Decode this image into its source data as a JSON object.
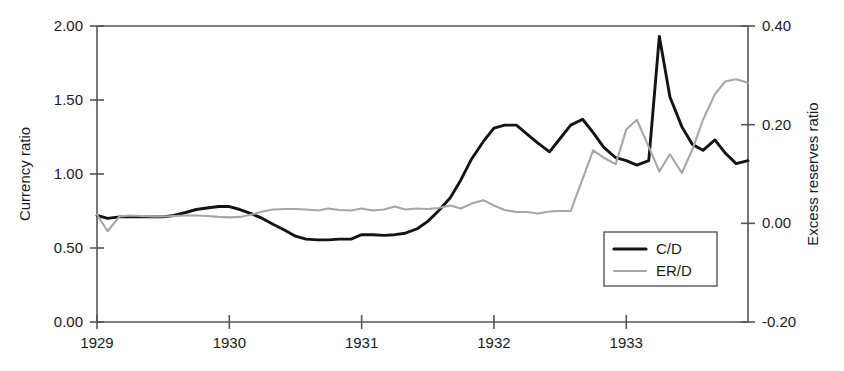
{
  "chart_data": {
    "type": "line",
    "title": "",
    "xlabel": "",
    "ylabel": "Currency ratio",
    "y2label": "Excess reserves ratio",
    "grid": false,
    "legend_position": "inside-bottom-right",
    "xlim": [
      1929.0,
      1933.92
    ],
    "ylim": [
      0.0,
      2.0
    ],
    "y2lim": [
      -0.2,
      0.4
    ],
    "xticks": [
      "1929",
      "1930",
      "1931",
      "1932",
      "1933"
    ],
    "xtick_values": [
      1929,
      1930,
      1931,
      1932,
      1933
    ],
    "yticks": [
      "0.00",
      "0.50",
      "1.00",
      "1.50",
      "2.00"
    ],
    "ytick_values": [
      0.0,
      0.5,
      1.0,
      1.5,
      2.0
    ],
    "y2ticks": [
      "-0.20",
      "0.00",
      "0.20",
      "0.40"
    ],
    "y2tick_values": [
      -0.2,
      0.0,
      0.2,
      0.4
    ],
    "series": [
      {
        "name": "C/D",
        "axis": "left",
        "color": "#141414",
        "x": [
          1929.0,
          1929.08,
          1929.17,
          1929.25,
          1929.33,
          1929.42,
          1929.5,
          1929.58,
          1929.67,
          1929.75,
          1929.83,
          1929.92,
          1930.0,
          1930.08,
          1930.17,
          1930.25,
          1930.33,
          1930.42,
          1930.5,
          1930.58,
          1930.67,
          1930.75,
          1930.83,
          1930.92,
          1931.0,
          1931.08,
          1931.17,
          1931.25,
          1931.33,
          1931.42,
          1931.5,
          1931.58,
          1931.67,
          1931.75,
          1931.83,
          1931.92,
          1932.0,
          1932.08,
          1932.17,
          1932.25,
          1932.33,
          1932.42,
          1932.5,
          1932.58,
          1932.67,
          1932.75,
          1932.83,
          1932.92,
          1933.0,
          1933.08,
          1933.17,
          1933.25,
          1933.33,
          1933.42,
          1933.5,
          1933.58,
          1933.67,
          1933.75,
          1933.83,
          1933.92
        ],
        "values": [
          0.72,
          0.7,
          0.71,
          0.71,
          0.71,
          0.71,
          0.71,
          0.72,
          0.74,
          0.76,
          0.77,
          0.78,
          0.78,
          0.76,
          0.73,
          0.7,
          0.66,
          0.62,
          0.58,
          0.56,
          0.555,
          0.555,
          0.56,
          0.56,
          0.59,
          0.59,
          0.585,
          0.59,
          0.6,
          0.63,
          0.68,
          0.75,
          0.84,
          0.96,
          1.1,
          1.22,
          1.31,
          1.33,
          1.33,
          1.27,
          1.21,
          1.15,
          1.24,
          1.33,
          1.37,
          1.28,
          1.18,
          1.11,
          1.09,
          1.06,
          1.09,
          1.93,
          1.52,
          1.32,
          1.2,
          1.16,
          1.23,
          1.14,
          1.07,
          1.09
        ]
      },
      {
        "name": "ER/D",
        "axis": "right",
        "color": "#a6a6a6",
        "x": [
          1929.0,
          1929.08,
          1929.17,
          1929.25,
          1929.33,
          1929.42,
          1929.5,
          1929.58,
          1929.67,
          1929.75,
          1929.83,
          1929.92,
          1930.0,
          1930.08,
          1930.17,
          1930.25,
          1930.33,
          1930.42,
          1930.5,
          1930.58,
          1930.67,
          1930.75,
          1930.83,
          1930.92,
          1931.0,
          1931.08,
          1931.17,
          1931.25,
          1931.33,
          1931.42,
          1931.5,
          1931.58,
          1931.67,
          1931.75,
          1931.83,
          1931.92,
          1932.0,
          1932.08,
          1932.17,
          1932.25,
          1932.33,
          1932.42,
          1932.5,
          1932.58,
          1932.67,
          1932.75,
          1932.83,
          1932.92,
          1933.0,
          1933.08,
          1933.17,
          1933.25,
          1933.33,
          1933.42,
          1933.5,
          1933.58,
          1933.67,
          1933.75,
          1933.83,
          1933.92
        ],
        "values": [
          0.018,
          -0.016,
          0.014,
          0.016,
          0.015,
          0.014,
          0.014,
          0.015,
          0.016,
          0.016,
          0.015,
          0.013,
          0.012,
          0.013,
          0.018,
          0.024,
          0.028,
          0.029,
          0.029,
          0.028,
          0.026,
          0.03,
          0.027,
          0.026,
          0.03,
          0.026,
          0.028,
          0.034,
          0.028,
          0.03,
          0.029,
          0.031,
          0.036,
          0.03,
          0.04,
          0.047,
          0.036,
          0.027,
          0.023,
          0.023,
          0.02,
          0.024,
          0.025,
          0.025,
          0.09,
          0.148,
          0.133,
          0.12,
          0.19,
          0.21,
          0.155,
          0.105,
          0.14,
          0.102,
          0.15,
          0.21,
          0.262,
          0.288,
          0.292,
          0.285
        ]
      }
    ]
  },
  "legend": {
    "items": [
      {
        "label": "C/D",
        "color": "#141414"
      },
      {
        "label": "ER/D",
        "color": "#a6a6a6"
      }
    ]
  },
  "axes": {
    "left_title": "Currency ratio",
    "right_title": "Excess reserves ratio"
  }
}
